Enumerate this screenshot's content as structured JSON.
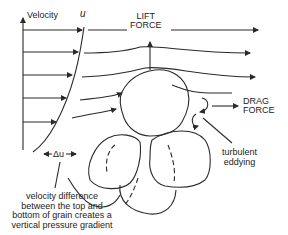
{
  "diagram": {
    "axis_label": "Velocity",
    "profile_label": "u",
    "lift_force": [
      "LIFT",
      "FORCE"
    ],
    "drag_force": [
      "DRAG",
      "FORCE"
    ],
    "eddy_label": [
      "turbulent",
      "eddying"
    ],
    "delta_label": "Δu",
    "caption": [
      "velocity difference",
      "between the top and",
      "bottom of grain creates a",
      "vertical pressure gradient"
    ],
    "colors": {
      "line": "#2a2a2a",
      "background": "#ffffff"
    }
  }
}
